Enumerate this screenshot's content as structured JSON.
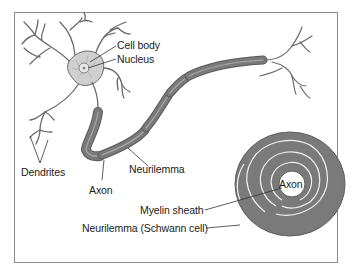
{
  "diagram": {
    "colors": {
      "background": "#ffffff",
      "frame": "#8a8a8a",
      "outline": "#5a5a5a",
      "myelin": "#7a7a7a",
      "myelin_highlight": "#a8a8a8",
      "cell_body": "#cfcfcf",
      "label_text": "#1a1a1a"
    },
    "labels": {
      "cell_body": "Cell body",
      "nucleus": "Nucleus",
      "dendrites": "Dendrites",
      "axon": "Axon",
      "neurilemma": "Neurilemma",
      "cross_section_axon": "Axon",
      "myelin_sheath": "Myelin sheath",
      "neurilemma_schwann": "Neurilemma (Schwann cell)"
    }
  }
}
